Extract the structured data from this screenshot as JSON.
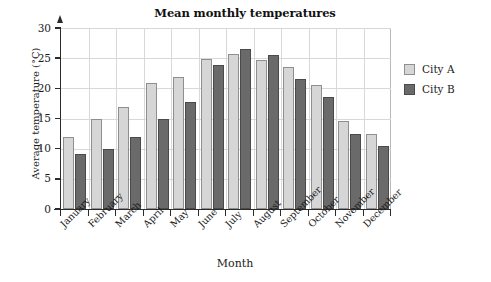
{
  "chart_data": {
    "type": "bar",
    "title": "Mean monthly temperatures",
    "xlabel": "Month",
    "ylabel": "Average temperature (°C)",
    "categories": [
      "January",
      "February",
      "March",
      "April",
      "May",
      "June",
      "July",
      "August",
      "September",
      "October",
      "November",
      "December"
    ],
    "series": [
      {
        "name": "City A",
        "color": "#d6d6d6",
        "values": [
          12.0,
          15.0,
          16.9,
          20.9,
          21.8,
          24.8,
          25.7,
          24.7,
          23.5,
          20.6,
          14.6,
          12.4
        ]
      },
      {
        "name": "City B",
        "color": "#6a6a6a",
        "values": [
          9.1,
          10.0,
          11.9,
          14.9,
          17.8,
          23.8,
          26.6,
          25.6,
          21.5,
          18.6,
          12.5,
          10.4
        ]
      }
    ],
    "ylim": [
      0,
      30
    ],
    "yticks": [
      0,
      5,
      10,
      15,
      20,
      25,
      30
    ],
    "ytick_labels": [
      "0",
      "5",
      "10",
      "15",
      "20",
      "25",
      "30"
    ],
    "grid": true,
    "legend_position": "right"
  },
  "legend": {
    "entries": [
      {
        "label": "City A"
      },
      {
        "label": "City B"
      }
    ]
  }
}
